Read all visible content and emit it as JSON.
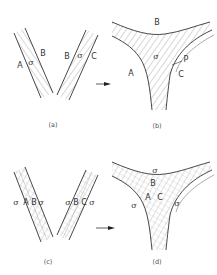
{
  "figure": {
    "panels": [
      {
        "id": "a",
        "caption": "(a)",
        "description": "Two separate inclined boundary layers forming a V; left layer between phases A and B, right layer between phases B and C",
        "labels": {
          "left_outer": "A",
          "left_layer": "σ",
          "left_inner": "B",
          "right_inner": "B",
          "right_layer": "σ",
          "right_outer": "C"
        }
      },
      {
        "id": "b",
        "caption": "(b)",
        "description": "Three-phase junction with hatched σ region bounded by curved interfaces",
        "labels": {
          "top": "B",
          "center": "σ",
          "left": "A",
          "right": "C",
          "point": "P"
        }
      },
      {
        "id": "c",
        "caption": "(c)",
        "description": "Two inclined layers each containing sub-layers σ A B σ and σ B C σ",
        "labels": {
          "left": [
            "σ",
            "A",
            "B",
            "σ"
          ],
          "right": [
            "σ",
            "B",
            "C",
            "σ"
          ]
        }
      },
      {
        "id": "d",
        "caption": "(d)",
        "description": "Merged three-phase junction with cross-hatched core containing B, A, C sub-regions surrounded by σ",
        "labels": {
          "top": "σ",
          "inner_top": "B",
          "inner_left": "A",
          "inner_right": "C",
          "left": "σ",
          "right": "σ"
        }
      }
    ],
    "arrows": [
      {
        "from": "a",
        "to": "b"
      },
      {
        "from": "c",
        "to": "d"
      }
    ],
    "colors": {
      "line": "#333333",
      "hatch": "#777777",
      "background": "#ffffff"
    }
  }
}
